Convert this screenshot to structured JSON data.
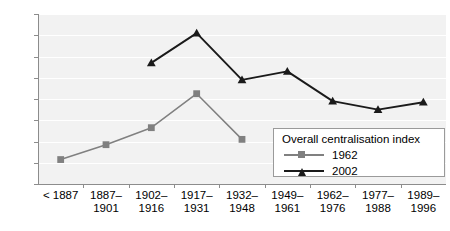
{
  "chart_data": {
    "type": "line",
    "title": "",
    "xlabel": "",
    "ylabel": "",
    "ylim": [
      0,
      1.6
    ],
    "ytick_labels": [
      "0",
      "0.2",
      "0.4",
      "0.6",
      "0.8",
      "1",
      "1.2",
      "1.4",
      "1.6"
    ],
    "ytick_values": [
      0,
      0.2,
      0.4,
      0.6,
      0.8,
      1.0,
      1.2,
      1.4,
      1.6
    ],
    "grid": true,
    "legend_position": "lower-right",
    "legend_title": "Overall centralisation index",
    "categories": [
      "< 1887",
      "1887–\n1901",
      "1902–\n1916",
      "1917–\n1931",
      "1932–\n1948",
      "1949–\n1961",
      "1962–\n1976",
      "1977–\n1988",
      "1989–\n1996"
    ],
    "category_lines": [
      [
        "< 1887",
        ""
      ],
      [
        "1887–",
        "1901"
      ],
      [
        "1902–",
        "1916"
      ],
      [
        "1917–",
        "1931"
      ],
      [
        "1932–",
        "1948"
      ],
      [
        "1949–",
        "1961"
      ],
      [
        "1962–",
        "1976"
      ],
      [
        "1977–",
        "1988"
      ],
      [
        "1989–",
        "1996"
      ]
    ],
    "series": [
      {
        "name": "1962",
        "color": "#808080",
        "marker": "square",
        "values": [
          0.23,
          0.37,
          0.53,
          0.85,
          0.42,
          null,
          null,
          null,
          null
        ]
      },
      {
        "name": "2002",
        "color": "#1a1a1a",
        "marker": "triangle",
        "values": [
          null,
          null,
          1.14,
          1.42,
          0.98,
          1.06,
          0.78,
          0.7,
          0.77
        ]
      }
    ]
  },
  "colors": {
    "plot_background": "#f2f2f2",
    "gridline": "#ffffff",
    "axis": "#8c8c8c",
    "series_1962": "#808080",
    "series_2002": "#1a1a1a",
    "legend_border": "#9a9a9a",
    "legend_background": "#ffffff"
  },
  "legend": {
    "title": "Overall centralisation index",
    "entries": [
      {
        "label": "1962",
        "color": "#808080",
        "marker": "square-marker"
      },
      {
        "label": "2002",
        "color": "#1a1a1a",
        "marker": "triangle-marker"
      }
    ]
  }
}
